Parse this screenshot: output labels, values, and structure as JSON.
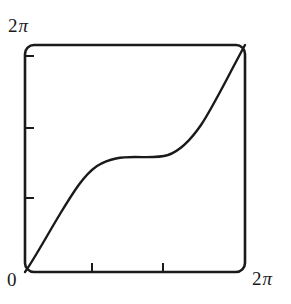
{
  "figure": {
    "background_color": "#ffffff",
    "ink_color": "#1a1a1a",
    "frame": {
      "x0": 25,
      "y0": 45,
      "x1": 245,
      "y1": 272,
      "corner_radius": 9,
      "stroke_width": 2.6
    }
  },
  "labels": {
    "y_max_number": "2",
    "y_max_symbol": "π",
    "origin": "0",
    "x_max_number": "2",
    "x_max_symbol": "π"
  },
  "chart_data": {
    "type": "line",
    "title": "",
    "xlabel": "",
    "ylabel": "",
    "xlim": [
      0,
      6.2832
    ],
    "ylim": [
      0,
      6.2832
    ],
    "xtick_labels": [
      "0",
      "2π"
    ],
    "ytick_labels": [
      "0",
      "2π"
    ],
    "xticks_unlabeled_px": [
      92,
      163
    ],
    "yticks_unlabeled_px": [
      56,
      128,
      198
    ],
    "grid": false,
    "legend": null,
    "series": [
      {
        "name": "circle-map",
        "color": "#1a1a1a",
        "stroke_width": 2.4,
        "x": [
          0.0,
          0.16,
          0.31,
          0.47,
          0.63,
          0.79,
          0.94,
          1.1,
          1.26,
          1.41,
          1.57,
          1.73,
          1.88,
          2.04,
          2.2,
          2.36,
          2.51,
          2.67,
          2.83,
          2.98,
          3.14,
          3.3,
          3.46,
          3.61,
          3.77,
          3.93,
          4.08,
          4.24,
          4.4,
          4.55,
          4.71,
          4.87,
          5.03,
          5.18,
          5.34,
          5.5,
          5.65,
          5.81,
          5.97,
          6.12,
          6.28
        ],
        "y": [
          0.0,
          0.3,
          0.6,
          0.9,
          1.18,
          1.45,
          1.7,
          1.94,
          2.15,
          2.34,
          2.5,
          2.64,
          2.76,
          2.86,
          2.93,
          2.99,
          3.04,
          3.08,
          3.11,
          3.13,
          3.14,
          3.15,
          3.17,
          3.2,
          3.24,
          3.29,
          3.35,
          3.43,
          3.53,
          3.65,
          3.79,
          3.95,
          4.14,
          4.36,
          4.6,
          4.87,
          5.16,
          5.47,
          5.79,
          6.05,
          6.28
        ],
        "pixel_path": "M 25 272 C 33 261 45 239 60 214 C 74 191 84 175 97 166 C 110 158 122 157 135 157 C 148 157 158 158 168 155 C 180 151 190 141 201 125 C 213 107 226 80 245 45"
      }
    ],
    "annotations": []
  }
}
